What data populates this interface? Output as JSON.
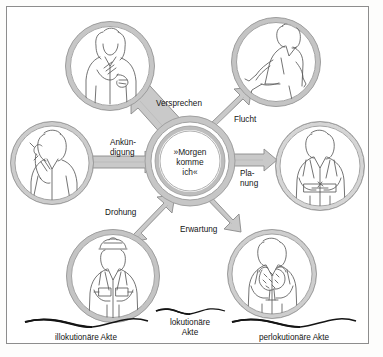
{
  "figure": {
    "background_color": "#ffffff",
    "frame_color": "#8d8d8d",
    "ring_fill": "#d2d2d2",
    "ring_stroke": "#9a9a9a",
    "arrow_fill": "#c9c9c9",
    "arrow_stroke": "#8a8a8a",
    "text_color": "#141414"
  },
  "center": {
    "name": "locutionary-utterance",
    "line1": "»Morgen",
    "line2": "komme",
    "line3": "ich«"
  },
  "arrows": [
    {
      "id": "versprechen",
      "label": "Versprechen",
      "direction": "inward",
      "from": "top-left-circle",
      "to": "center"
    },
    {
      "id": "ankuendigung",
      "label_line1": "Ankün-",
      "label_line2": "digung",
      "label": "Ankündigung",
      "direction": "inward",
      "from": "left-circle",
      "to": "center"
    },
    {
      "id": "drohung",
      "label": "Drohung",
      "direction": "inward",
      "from": "bottom-left-circle",
      "to": "center"
    },
    {
      "id": "flucht",
      "label": "Flucht",
      "direction": "outward",
      "from": "center",
      "to": "top-right-circle"
    },
    {
      "id": "planung",
      "label_line1": "Pla-",
      "label_line2": "nung",
      "label": "Planung",
      "direction": "outward",
      "from": "center",
      "to": "right-circle"
    },
    {
      "id": "erwartung",
      "label": "Erwartung",
      "direction": "outward",
      "from": "center",
      "to": "bottom-right-circle"
    }
  ],
  "circles": [
    {
      "id": "top-left-circle",
      "illustration": "woman-hand-on-chest-promise-icon",
      "act": "Versprechen"
    },
    {
      "id": "left-circle",
      "illustration": "man-on-telephone-icon",
      "act": "Ankündigung"
    },
    {
      "id": "bottom-left-circle",
      "illustration": "police-officer-uniform-icon",
      "act": "Drohung"
    },
    {
      "id": "top-right-circle",
      "illustration": "running-person-icon",
      "act": "Flucht"
    },
    {
      "id": "right-circle",
      "illustration": "man-writing-at-desk-icon",
      "act": "Planung"
    },
    {
      "id": "bottom-right-circle",
      "illustration": "man-with-flower-bouquet-icon",
      "act": "Erwartung"
    }
  ],
  "bottom_labels": {
    "illocutionary": "illokutionäre Akte",
    "locutionary_line1": "lokutionäre",
    "locutionary_line2": "Akte",
    "perlocutionary": "perlokutionäre Akte"
  }
}
